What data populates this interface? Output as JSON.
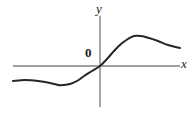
{
  "figure": {
    "title": "",
    "background_color": "#ffffff",
    "width": 195,
    "height": 114
  },
  "labels": {
    "y_axis": "y",
    "x_axis": "x",
    "origin": "0"
  },
  "colors": {
    "axis": "#808080",
    "curve": "#262626",
    "text": "#1a1a1a",
    "background": "#ffffff"
  },
  "chart_data": {
    "type": "line",
    "title": "",
    "xlabel": "x",
    "ylabel": "y",
    "grid": false,
    "legend": null,
    "annotations": [
      {
        "text": "0",
        "role": "origin-marker",
        "x": 0,
        "y": 0
      }
    ],
    "axes": {
      "x_axis_pixel_y": 66,
      "y_axis_pixel_x": 100,
      "x_axis_pixel_start": 13,
      "x_axis_pixel_end": 180,
      "y_axis_pixel_top": 16,
      "y_axis_pixel_bottom": 107,
      "arrowheads": false,
      "ticks": []
    },
    "series": [
      {
        "name": "curve",
        "color": "#262626",
        "points_pixel": [
          [
            13,
            81
          ],
          [
            25,
            80
          ],
          [
            38,
            81
          ],
          [
            50,
            83
          ],
          [
            58,
            85
          ],
          [
            64,
            85
          ],
          [
            70,
            84
          ],
          [
            77,
            81
          ],
          [
            84,
            76
          ],
          [
            92,
            71
          ],
          [
            100,
            66
          ],
          [
            107,
            59
          ],
          [
            114,
            51
          ],
          [
            121,
            44
          ],
          [
            128,
            39
          ],
          [
            134,
            36
          ],
          [
            141,
            36
          ],
          [
            149,
            38
          ],
          [
            158,
            41
          ],
          [
            168,
            45
          ],
          [
            180,
            48
          ]
        ],
        "key_points": {
          "left_end": [
            13,
            81
          ],
          "local_minimum": [
            64,
            85
          ],
          "inflection_origin": [
            100,
            66
          ],
          "local_maximum": [
            134,
            36
          ],
          "right_end": [
            180,
            48
          ]
        }
      }
    ]
  }
}
